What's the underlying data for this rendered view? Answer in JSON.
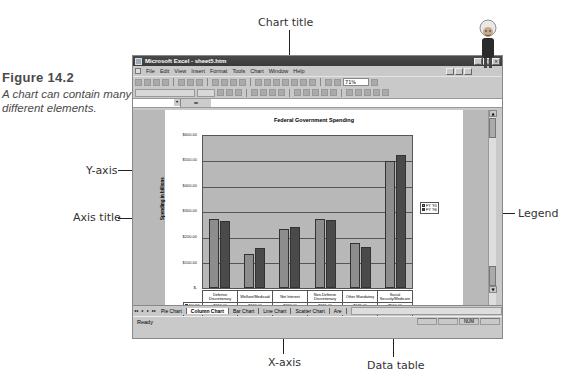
{
  "figure": {
    "number_label": "Figure 14.2",
    "caption": "A chart can contain many different elements."
  },
  "callouts": {
    "chart_title": "Chart title",
    "y_axis": "Y-axis",
    "axis_title": "Axis title",
    "legend": "Legend",
    "x_axis": "X-axis",
    "data_table": "Data table"
  },
  "window": {
    "title": "Microsoft Excel - sheet5.htm",
    "buttons": [
      "_",
      "□",
      "×"
    ]
  },
  "menubar": {
    "items": [
      "File",
      "Edit",
      "View",
      "Insert",
      "Format",
      "Tools",
      "Chart",
      "Window",
      "Help"
    ]
  },
  "toolbar": {
    "zoom": "71%"
  },
  "formula_bar": {
    "name_box": "",
    "eq": "="
  },
  "sheet_tabs": {
    "nav": [
      "◂◂",
      "◂",
      "▸",
      "▸▸"
    ],
    "tabs": [
      "Pie Chart",
      "Column Chart",
      "Bar Chart",
      "Line Chart",
      "Scatter Chart",
      "Are"
    ],
    "active": "Column Chart"
  },
  "statusbar": {
    "status": "Ready",
    "indicator": "NUM"
  },
  "chart_data": {
    "type": "bar",
    "title": "Federal Government Spending",
    "xlabel": "",
    "ylabel": "Spending in billions",
    "ylim": [
      0,
      600
    ],
    "yticks": [
      "$-",
      "$100.00",
      "$200.00",
      "$300.00",
      "$400.00",
      "$500.00",
      "$600.00"
    ],
    "grid": true,
    "legend_position": "right",
    "categories": [
      "Defense Discretionary",
      "Welfare/Medicaid",
      "Net Interest",
      "Non-Defense Discretionary",
      "Other Mandatory",
      "Social Security/Medicare"
    ],
    "series": [
      {
        "name": "FY '95",
        "color": "#8d8d8d",
        "values": [
          274,
          133,
          232,
          271,
          179,
          500
        ],
        "labels": [
          "$274.00",
          "$133.00",
          "$232.00",
          "$271.00",
          "$179.00",
          "$500.00"
        ]
      },
      {
        "name": "FY '96",
        "color": "#4a4a4a",
        "values": [
          266,
          159,
          241,
          267,
          162,
          526
        ],
        "labels": [
          "$266.00",
          "$159.00",
          "$241.00",
          "$267.00",
          "$162.00",
          "$526.00"
        ]
      }
    ]
  }
}
